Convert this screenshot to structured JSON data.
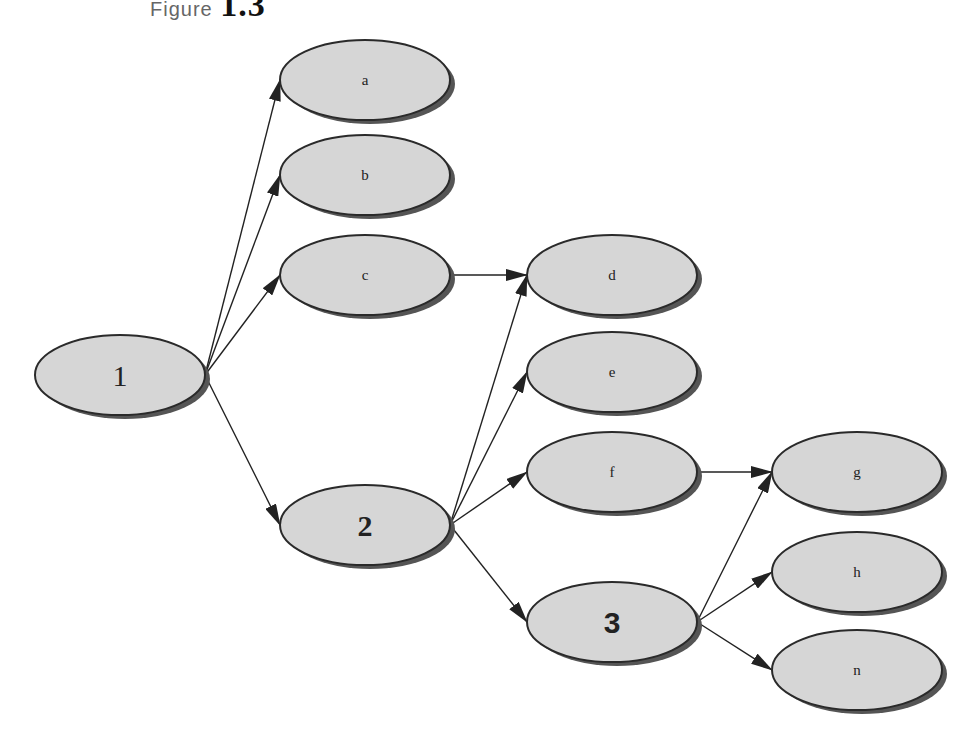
{
  "caption": {
    "word": "Figure",
    "number": "1.3"
  },
  "style": {
    "node_fill": "#d6d6d6",
    "node_stroke": "#2a2a2a",
    "node_shadow": "#555555",
    "edge_color": "#222222"
  },
  "nodes": [
    {
      "id": "1",
      "label": "1",
      "cx": 120,
      "cy": 375,
      "size": "big1"
    },
    {
      "id": "a",
      "label": "a",
      "cx": 365,
      "cy": 80,
      "size": "small"
    },
    {
      "id": "b",
      "label": "b",
      "cx": 365,
      "cy": 175,
      "size": "small"
    },
    {
      "id": "c",
      "label": "c",
      "cx": 365,
      "cy": 275,
      "size": "small"
    },
    {
      "id": "2",
      "label": "2",
      "cx": 365,
      "cy": 525,
      "size": "big2"
    },
    {
      "id": "d",
      "label": "d",
      "cx": 612,
      "cy": 275,
      "size": "small"
    },
    {
      "id": "e",
      "label": "e",
      "cx": 612,
      "cy": 372,
      "size": "small"
    },
    {
      "id": "f",
      "label": "f",
      "cx": 612,
      "cy": 472,
      "size": "small"
    },
    {
      "id": "3",
      "label": "3",
      "cx": 612,
      "cy": 622,
      "size": "big3"
    },
    {
      "id": "g",
      "label": "g",
      "cx": 857,
      "cy": 472,
      "size": "small"
    },
    {
      "id": "h",
      "label": "h",
      "cx": 857,
      "cy": 572,
      "size": "small"
    },
    {
      "id": "n",
      "label": "n",
      "cx": 857,
      "cy": 670,
      "size": "small"
    }
  ],
  "edges": [
    {
      "from": "1",
      "to": "a"
    },
    {
      "from": "1",
      "to": "b"
    },
    {
      "from": "1",
      "to": "c"
    },
    {
      "from": "1",
      "to": "2"
    },
    {
      "from": "c",
      "to": "d"
    },
    {
      "from": "2",
      "to": "d"
    },
    {
      "from": "2",
      "to": "e"
    },
    {
      "from": "2",
      "to": "f"
    },
    {
      "from": "2",
      "to": "3"
    },
    {
      "from": "f",
      "to": "g"
    },
    {
      "from": "3",
      "to": "g"
    },
    {
      "from": "3",
      "to": "h"
    },
    {
      "from": "3",
      "to": "n"
    }
  ]
}
